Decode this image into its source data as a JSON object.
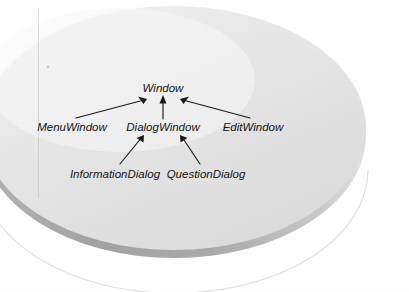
{
  "figure": {
    "kind": "class-hierarchy-diagram",
    "background_color": "#ffffff",
    "disc": {
      "top_face_color": "#e2e2e2",
      "top_face_highlight_color": "#f4f4f4",
      "edge_color": "#a8a8a8",
      "edge_shadow_color": "#9a9a9a"
    },
    "arrow_color": "#1a1a1a",
    "label_color": "#141414"
  },
  "diagram": {
    "nodes": [
      {
        "id": "window",
        "label": "Window",
        "level": 0,
        "x": 163,
        "y": 88
      },
      {
        "id": "menu-window",
        "label": "MenuWindow",
        "level": 1,
        "x": 72,
        "y": 127
      },
      {
        "id": "dialog-window",
        "label": "DialogWindow",
        "level": 1,
        "x": 163,
        "y": 127
      },
      {
        "id": "edit-window",
        "label": "EditWindow",
        "level": 1,
        "x": 253,
        "y": 127
      },
      {
        "id": "information-dialog",
        "label": "InformationDialog",
        "level": 2,
        "x": 115,
        "y": 174
      },
      {
        "id": "question-dialog",
        "label": "QuestionDialog",
        "level": 2,
        "x": 206,
        "y": 174
      }
    ],
    "edges": [
      {
        "id": "menu-to-window",
        "from": "menu-window",
        "to": "window",
        "kind": "inheritance-arrow"
      },
      {
        "id": "dialog-to-window",
        "from": "dialog-window",
        "to": "window",
        "kind": "inheritance-arrow"
      },
      {
        "id": "edit-to-window",
        "from": "edit-window",
        "to": "window",
        "kind": "inheritance-arrow"
      },
      {
        "id": "information-to-dialog",
        "from": "information-dialog",
        "to": "dialog-window",
        "kind": "inheritance-arrow"
      },
      {
        "id": "question-to-dialog",
        "from": "question-dialog",
        "to": "dialog-window",
        "kind": "inheritance-arrow"
      }
    ]
  }
}
